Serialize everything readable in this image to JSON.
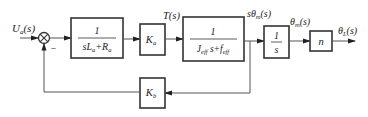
{
  "diagram": {
    "type": "control-block-diagram",
    "input_label": {
      "main": "U",
      "sub": "a",
      "tail": "(s)"
    },
    "summing_junction": {
      "symbol": "⊗",
      "feedback_sign": "−"
    },
    "blocks": [
      {
        "id": "armature",
        "numerator": "1",
        "denominator": {
          "p1": "sL",
          "p1sub": "a",
          "p2": "+R",
          "p2sub": "a"
        }
      },
      {
        "id": "torque_constant",
        "main": "K",
        "sub": "a"
      },
      {
        "id": "mechanical",
        "numerator": "1",
        "denominator": {
          "p1": "J",
          "p1sub": "eff",
          "p2": " s+f",
          "p2sub": "eff"
        }
      },
      {
        "id": "integrator",
        "numerator": "1",
        "denominator": "s"
      },
      {
        "id": "gear",
        "main": "n"
      },
      {
        "id": "back_emf",
        "main": "K",
        "sub": "b"
      }
    ],
    "signals": {
      "torque": "T(s)",
      "motor_speed": {
        "pre": "sθ",
        "sub": "m",
        "tail": "(s)"
      },
      "motor_angle": {
        "pre": "θ",
        "sub": "m",
        "tail": "(s)"
      },
      "load_angle": {
        "pre": "θ",
        "sub": "L",
        "tail": "(s)"
      }
    }
  }
}
